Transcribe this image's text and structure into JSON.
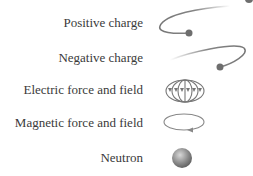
{
  "legend": {
    "items": [
      {
        "label": "Positive charge",
        "icon": "positive-charge-icon"
      },
      {
        "label": "Negative charge",
        "icon": "negative-charge-icon"
      },
      {
        "label": "Electric force and field",
        "icon": "electric-field-icon"
      },
      {
        "label": "Magnetic force and field",
        "icon": "magnetic-field-icon"
      },
      {
        "label": "Neutron",
        "icon": "neutron-icon"
      }
    ]
  },
  "colors": {
    "line": "#7a7a7a",
    "dot": "#6e6e6e",
    "text": "#3a3a3a"
  }
}
